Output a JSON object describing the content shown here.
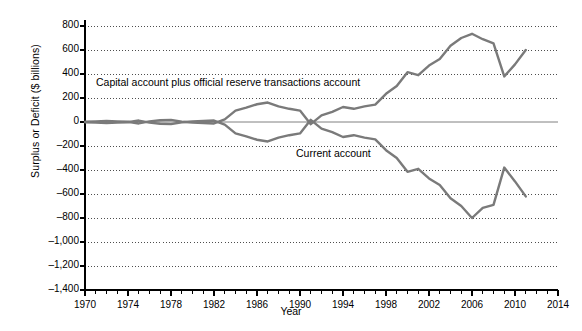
{
  "chart_data": {
    "type": "line",
    "title": "",
    "xlabel": "Year",
    "ylabel": "Surplus or Deficit ($ billions)",
    "xlim": [
      1970,
      2014
    ],
    "ylim": [
      -1400,
      800
    ],
    "grid": true,
    "legend_position": "inline-annotation",
    "y_ticks": [
      "800",
      "600",
      "400",
      "200",
      "0",
      "–200",
      "–400",
      "–600",
      "–800",
      "–1,000",
      "–1,200",
      "–1,400"
    ],
    "y_tick_values": [
      800,
      600,
      400,
      200,
      0,
      -200,
      -400,
      -600,
      -800,
      -1000,
      -1200,
      -1400
    ],
    "x_ticks": [
      "1970",
      "1974",
      "1978",
      "1982",
      "1986",
      "1990",
      "1994",
      "1998",
      "2002",
      "2006",
      "2010",
      "2014"
    ],
    "x_tick_values": [
      1970,
      1974,
      1978,
      1982,
      1986,
      1990,
      1994,
      1998,
      2002,
      2006,
      2010,
      2014
    ],
    "x_minor_tick_interval": 1,
    "line_color": "#7a7a7a",
    "zero_line_color": "#808080",
    "axis_color": "#000000",
    "series": [
      {
        "name": "Capital account plus official reserve transactions account",
        "label_text": "Capital account plus official reserve transactions account",
        "x": [
          1970,
          1971,
          1972,
          1973,
          1974,
          1975,
          1976,
          1977,
          1978,
          1979,
          1980,
          1981,
          1982,
          1983,
          1984,
          1985,
          1986,
          1987,
          1988,
          1989,
          1990,
          1991,
          1992,
          1993,
          1994,
          1995,
          1996,
          1997,
          1998,
          1999,
          2000,
          2001,
          2002,
          2003,
          2004,
          2005,
          2006,
          2007,
          2008,
          2009,
          2010,
          2011
        ],
        "values": [
          2,
          5,
          8,
          5,
          2,
          -12,
          5,
          15,
          18,
          2,
          -5,
          -8,
          -12,
          22,
          95,
          120,
          148,
          162,
          130,
          110,
          95,
          -18,
          55,
          85,
          125,
          110,
          130,
          145,
          235,
          300,
          415,
          390,
          470,
          525,
          635,
          700,
          735,
          690,
          655,
          380,
          480,
          600
        ]
      },
      {
        "name": "Current account",
        "label_text": "Current account",
        "x": [
          1970,
          1971,
          1972,
          1973,
          1974,
          1975,
          1976,
          1977,
          1978,
          1979,
          1980,
          1981,
          1982,
          1983,
          1984,
          1985,
          1986,
          1987,
          1988,
          1989,
          1990,
          1991,
          1992,
          1993,
          1994,
          1995,
          1996,
          1997,
          1998,
          1999,
          2000,
          2001,
          2002,
          2003,
          2004,
          2005,
          2006,
          2007,
          2008,
          2009,
          2010,
          2011
        ],
        "values": [
          -2,
          -5,
          -8,
          -5,
          -2,
          12,
          -5,
          -15,
          -18,
          -2,
          5,
          8,
          12,
          -22,
          -95,
          -120,
          -148,
          -162,
          -130,
          -110,
          -95,
          18,
          -55,
          -85,
          -125,
          -110,
          -130,
          -145,
          -235,
          -300,
          -415,
          -390,
          -470,
          -525,
          -635,
          -700,
          -800,
          -715,
          -690,
          -380,
          -495,
          -620
        ]
      }
    ]
  },
  "annotations": {
    "capital_label": "Capital account plus official reserve transactions account",
    "current_label": "Current account"
  }
}
